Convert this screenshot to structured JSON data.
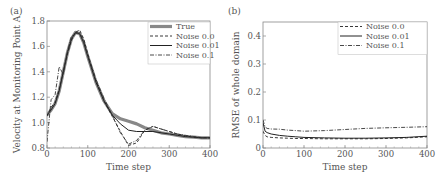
{
  "chart_data": [
    {
      "panel_label": "(a)",
      "type": "line",
      "title": "",
      "xlabel": "Time step",
      "ylabel": "Velocity at Monitoring Point A",
      "xlim": [
        0,
        400
      ],
      "ylim": [
        0.8,
        1.8
      ],
      "xticks": [
        "0",
        "100",
        "200",
        "300",
        "400"
      ],
      "yticks": [
        "0.8",
        "1.0",
        "1.2",
        "1.4",
        "1.6",
        "1.8"
      ],
      "grid": false,
      "legend_position": "upper right",
      "x": [
        0,
        10,
        20,
        30,
        40,
        50,
        60,
        70,
        80,
        90,
        100,
        120,
        140,
        160,
        180,
        200,
        220,
        240,
        260,
        280,
        300,
        320,
        340,
        360,
        380,
        400
      ],
      "series": [
        {
          "name": "True",
          "style": "thick-gray",
          "values": [
            1.06,
            1.1,
            1.15,
            1.25,
            1.4,
            1.55,
            1.66,
            1.71,
            1.7,
            1.63,
            1.52,
            1.32,
            1.17,
            1.07,
            1.03,
            1.01,
            0.99,
            0.96,
            0.94,
            0.92,
            0.91,
            0.9,
            0.89,
            0.885,
            0.88,
            0.88
          ]
        },
        {
          "name": "Noise 0.0",
          "style": "dashed",
          "values": [
            1.05,
            1.12,
            1.16,
            1.26,
            1.4,
            1.54,
            1.65,
            1.71,
            1.73,
            1.66,
            1.54,
            1.33,
            1.17,
            1.05,
            0.93,
            0.82,
            0.84,
            0.94,
            0.97,
            0.95,
            0.93,
            0.91,
            0.895,
            0.885,
            0.88,
            0.88
          ]
        },
        {
          "name": "Noise 0.01",
          "style": "solid",
          "values": [
            1.06,
            1.1,
            1.15,
            1.25,
            1.4,
            1.55,
            1.66,
            1.71,
            1.7,
            1.63,
            1.52,
            1.32,
            1.17,
            1.06,
            0.99,
            0.94,
            0.93,
            0.93,
            0.93,
            0.92,
            0.91,
            0.9,
            0.89,
            0.885,
            0.88,
            0.88
          ]
        },
        {
          "name": "Noise 0.1",
          "style": "dashdot",
          "values": [
            0.85,
            1.18,
            1.22,
            1.44,
            1.38,
            1.56,
            1.68,
            1.7,
            1.71,
            1.64,
            1.53,
            1.34,
            1.19,
            1.06,
            0.92,
            0.83,
            0.86,
            0.94,
            0.97,
            0.95,
            0.93,
            0.91,
            0.9,
            0.89,
            0.88,
            0.88
          ]
        }
      ]
    },
    {
      "panel_label": "(b)",
      "type": "line",
      "title": "",
      "xlabel": "Time step",
      "ylabel": "RMSE of whole domain",
      "xlim": [
        0,
        400
      ],
      "ylim": [
        0,
        0.45
      ],
      "xticks": [
        "0",
        "100",
        "200",
        "300",
        "400"
      ],
      "yticks": [
        "0",
        "0.1",
        "0.2",
        "0.3",
        "0.4"
      ],
      "grid": false,
      "legend_position": "upper right",
      "x": [
        0,
        5,
        10,
        20,
        40,
        60,
        80,
        100,
        150,
        200,
        250,
        300,
        350,
        400
      ],
      "series": [
        {
          "name": "Noise 0.0",
          "style": "dashed",
          "values": [
            0.06,
            0.045,
            0.04,
            0.038,
            0.036,
            0.035,
            0.034,
            0.034,
            0.033,
            0.033,
            0.033,
            0.034,
            0.036,
            0.04
          ]
        },
        {
          "name": "Noise 0.01",
          "style": "solid",
          "values": [
            0.09,
            0.06,
            0.055,
            0.05,
            0.045,
            0.042,
            0.04,
            0.038,
            0.036,
            0.035,
            0.035,
            0.036,
            0.038,
            0.042
          ]
        },
        {
          "name": "Noise 0.1",
          "style": "dashdot",
          "values": [
            0.1,
            0.075,
            0.07,
            0.068,
            0.067,
            0.064,
            0.062,
            0.06,
            0.062,
            0.066,
            0.07,
            0.072,
            0.074,
            0.076
          ]
        }
      ]
    }
  ]
}
